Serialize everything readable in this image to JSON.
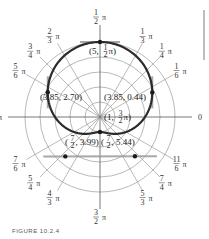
{
  "chart_data": {
    "type": "polar",
    "title": "",
    "equation_implied": "r = 3 + 2 sin θ",
    "rmax": 5,
    "rings": [
      1,
      2,
      3,
      4,
      5
    ],
    "angle_labels": [
      {
        "num": "",
        "den": "",
        "text": "0",
        "angle_deg": 0
      },
      {
        "num": "1",
        "den": "6",
        "text": "π",
        "angle_deg": 30
      },
      {
        "num": "1",
        "den": "4",
        "text": "π",
        "angle_deg": 45
      },
      {
        "num": "1",
        "den": "3",
        "text": "π",
        "angle_deg": 60
      },
      {
        "num": "1",
        "den": "2",
        "text": "π",
        "angle_deg": 90
      },
      {
        "num": "2",
        "den": "3",
        "text": "π",
        "angle_deg": 120
      },
      {
        "num": "3",
        "den": "4",
        "text": "π",
        "angle_deg": 135
      },
      {
        "num": "5",
        "den": "6",
        "text": "π",
        "angle_deg": 150
      },
      {
        "num": "",
        "den": "",
        "text": "π",
        "angle_deg": 180
      },
      {
        "num": "7",
        "den": "6",
        "text": "π",
        "angle_deg": 210
      },
      {
        "num": "5",
        "den": "4",
        "text": "π",
        "angle_deg": 225
      },
      {
        "num": "4",
        "den": "3",
        "text": "π",
        "angle_deg": 240
      },
      {
        "num": "3",
        "den": "2",
        "text": "π",
        "angle_deg": 270
      },
      {
        "num": "5",
        "den": "3",
        "text": "π",
        "angle_deg": 300
      },
      {
        "num": "7",
        "den": "4",
        "text": "π",
        "angle_deg": 315
      },
      {
        "num": "11",
        "den": "6",
        "text": "π",
        "angle_deg": 330
      }
    ],
    "points": [
      {
        "label": "(5, ½π)",
        "r": 5,
        "theta": "π/2",
        "text_a": "(5,",
        "frac_num": "1",
        "frac_den": "2",
        "text_b": "π)"
      },
      {
        "label": "(3.85, 2.70)",
        "r": 3.85,
        "theta": 2.7,
        "text": "(3.85, 2.70)"
      },
      {
        "label": "(3.85, 0.44)",
        "r": 3.85,
        "theta": 0.44,
        "text": "(3.85, 0.44)"
      },
      {
        "label": "(1, 3/2 π)",
        "r": 1,
        "theta": "3π/2",
        "text_a": "(1,",
        "frac_num": "3",
        "frac_den": "2",
        "text_b": "π)"
      },
      {
        "label": "(7/2, 3.99)",
        "r": 3.5,
        "theta": 3.99,
        "text_a": "(",
        "frac_num": "7",
        "frac_den": "2",
        "text_b": ", 3.99)"
      },
      {
        "label": "(7/2, 5.44)",
        "r": 3.5,
        "theta": 5.44,
        "text_a": "(",
        "frac_num": "7",
        "frac_den": "2",
        "text_b": ", 5.44)"
      }
    ]
  },
  "figure": {
    "caption": "FIGURE 10.2.4"
  },
  "colors": {
    "curve": "#2b2b2b",
    "grid": "#8a8a8a",
    "tangent": "#9a9a9a",
    "text": "#333333"
  }
}
